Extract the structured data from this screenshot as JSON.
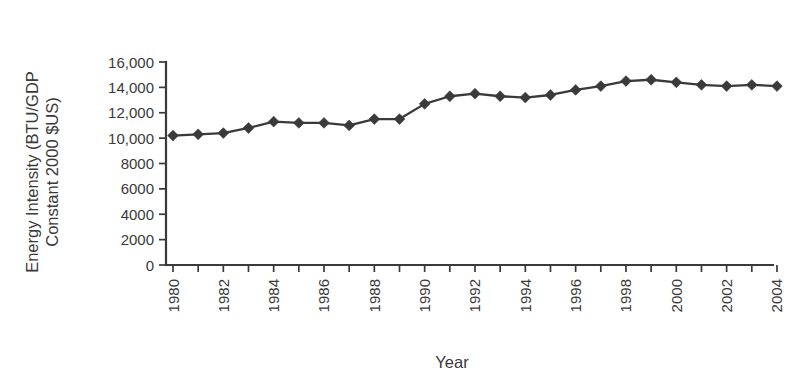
{
  "chart_data": {
    "type": "line",
    "title": "",
    "xlabel": "Year",
    "ylabel": "Energy Intensity (BTU/GDP Constant 2000 $US)",
    "ylabel_lines": [
      "Energy Intensity (BTU/GDP",
      "Constant 2000 $US)"
    ],
    "x": [
      1980,
      1981,
      1982,
      1983,
      1984,
      1985,
      1986,
      1987,
      1988,
      1989,
      1990,
      1991,
      1992,
      1993,
      1994,
      1995,
      1996,
      1997,
      1998,
      1999,
      2000,
      2001,
      2002,
      2003,
      2004
    ],
    "values": [
      10200,
      10300,
      10400,
      10800,
      11300,
      11200,
      11200,
      11000,
      11500,
      11500,
      12700,
      13300,
      13500,
      13300,
      13200,
      13400,
      13800,
      14100,
      14500,
      14600,
      14400,
      14200,
      14100,
      14200,
      14100
    ],
    "categories": [
      "1980",
      "1981",
      "1982",
      "1983",
      "1984",
      "1985",
      "1986",
      "1987",
      "1988",
      "1989",
      "1990",
      "1991",
      "1992",
      "1993",
      "1994",
      "1995",
      "1996",
      "1997",
      "1998",
      "1999",
      "2000",
      "2001",
      "2002",
      "2003",
      "2004"
    ],
    "xtick_labels_shown": [
      "1980",
      "1982",
      "1984",
      "1986",
      "1988",
      "1990",
      "1992",
      "1994",
      "1996",
      "1998",
      "2000",
      "2002",
      "2004"
    ],
    "ytick_labels": [
      "0",
      "2000",
      "4000",
      "6000",
      "8000",
      "10,000",
      "12,000",
      "14,000",
      "16,000"
    ],
    "ytick_values": [
      0,
      2000,
      4000,
      6000,
      8000,
      10000,
      12000,
      14000,
      16000
    ],
    "ylim": [
      0,
      16000
    ],
    "xlim": [
      1980,
      2004
    ],
    "grid": false,
    "legend": null,
    "marker": "diamond",
    "series_color": "#3a3a3a",
    "axis_color": "#3a3a3a",
    "background": "#ffffff",
    "xtick_rotation": 90
  }
}
